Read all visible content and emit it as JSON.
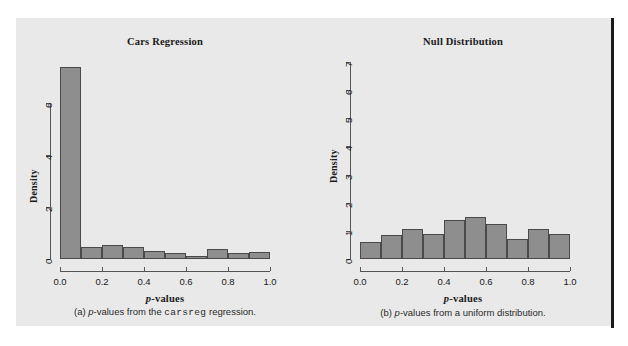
{
  "figure": {
    "background_color": "#e9e9e9",
    "page_background_color": "#ffffff",
    "edge_line_color": "#191919",
    "bar_fill_color": "#8e8e8e",
    "bar_border_color": "#4a4a4a",
    "axis_color": "#555555"
  },
  "panels": [
    {
      "id": "cars-regression",
      "title": "Cars Regression",
      "caption_prefix": "(a) ",
      "caption_italic": "p",
      "caption_mid": "-values from the ",
      "caption_mono": "carsreg",
      "caption_suffix": " regression.",
      "xlabel_italic": "p",
      "xlabel_rest": "-values",
      "ylabel": "Density"
    },
    {
      "id": "null-distribution",
      "title": "Null Distribution",
      "caption_prefix": "(b) ",
      "caption_italic": "p",
      "caption_mid": "-values from a uniform distribution.",
      "caption_mono": "",
      "caption_suffix": "",
      "xlabel_italic": "p",
      "xlabel_rest": "-values",
      "ylabel": "Density"
    }
  ],
  "chart_data": [
    {
      "type": "bar",
      "title": "Cars Regression",
      "xlabel": "p-values",
      "ylabel": "Density",
      "bin_edges": [
        0.0,
        0.1,
        0.2,
        0.3,
        0.4,
        0.5,
        0.6,
        0.7,
        0.8,
        0.9,
        1.0
      ],
      "categories": [
        "0.0-0.1",
        "0.1-0.2",
        "0.2-0.3",
        "0.3-0.4",
        "0.4-0.5",
        "0.5-0.6",
        "0.6-0.7",
        "0.7-0.8",
        "0.8-0.9",
        "0.9-1.0"
      ],
      "values": [
        7.4,
        0.45,
        0.55,
        0.45,
        0.3,
        0.25,
        0.12,
        0.4,
        0.22,
        0.28
      ],
      "xlim": [
        0.0,
        1.0
      ],
      "ylim": [
        0,
        7.6
      ],
      "xticks": [
        0.0,
        0.2,
        0.4,
        0.6,
        0.8,
        1.0
      ],
      "xtick_labels": [
        "0.0",
        "0.2",
        "0.4",
        "0.6",
        "0.8",
        "1.0"
      ],
      "yticks": [
        0,
        2,
        4,
        6
      ],
      "ytick_labels": [
        "0",
        "2",
        "4",
        "6"
      ],
      "grid": false,
      "legend": "none"
    },
    {
      "type": "bar",
      "title": "Null Distribution",
      "xlabel": "p-values",
      "ylabel": "Density",
      "bin_edges": [
        0.0,
        0.1,
        0.2,
        0.3,
        0.4,
        0.5,
        0.6,
        0.7,
        0.8,
        0.9,
        1.0
      ],
      "categories": [
        "0.0-0.1",
        "0.1-0.2",
        "0.2-0.3",
        "0.3-0.4",
        "0.4-0.5",
        "0.5-0.6",
        "0.6-0.7",
        "0.7-0.8",
        "0.8-0.9",
        "0.9-1.0"
      ],
      "values": [
        0.6,
        0.87,
        1.05,
        0.88,
        1.4,
        1.5,
        1.23,
        0.7,
        1.05,
        0.88
      ],
      "xlim": [
        0.0,
        1.0
      ],
      "ylim": [
        0,
        7.0
      ],
      "xticks": [
        0.0,
        0.2,
        0.4,
        0.6,
        0.8,
        1.0
      ],
      "xtick_labels": [
        "0.0",
        "0.2",
        "0.4",
        "0.6",
        "0.8",
        "1.0"
      ],
      "yticks": [
        0,
        1,
        2,
        3,
        4,
        5,
        6,
        7
      ],
      "ytick_labels": [
        "0",
        "1",
        "2",
        "3",
        "4",
        "5",
        "6",
        "7"
      ],
      "grid": false,
      "legend": "none"
    }
  ]
}
